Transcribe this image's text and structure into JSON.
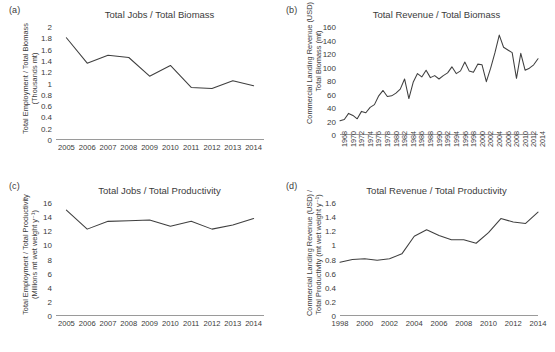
{
  "figure": {
    "background": "#ffffff",
    "line_color": "#3f3f3f",
    "axis_color": "#9a9a9a",
    "text_color": "#3b3b3b"
  },
  "panels": [
    {
      "label": "(a)",
      "name": "panel-a",
      "title": "Total Jobs / Total Biomass",
      "ylabel_line1": "Total Employment / Total Biomass",
      "ylabel_line2": "(Thousands mt)"
    },
    {
      "label": "(b)",
      "name": "panel-b",
      "title": "Total Revenue / Total Biomass",
      "ylabel_line1": "Commercial Landing Revenue (USD) /",
      "ylabel_line2": "Total Biomass (mt)"
    },
    {
      "label": "(c)",
      "name": "panel-c",
      "title": "Total Jobs / Total Productivity",
      "ylabel_line1": "Total Employment / Total Productivity",
      "ylabel_line2": "(Millions mt wet weight y⁻¹)"
    },
    {
      "label": "(d)",
      "name": "panel-d",
      "title": "Total Revenue / Total Productivity",
      "ylabel_line1": "Commercial Landing Revenue (USD) /",
      "ylabel_line2": "Total Productivity (mt wet weight y⁻¹)"
    }
  ],
  "chart_data": [
    {
      "panel": "(a)",
      "type": "line",
      "title": "Total Jobs / Total Biomass",
      "xlabel": "",
      "ylabel": "Total Employment / Total Biomass (Thousands mt)",
      "x": [
        2005,
        2006,
        2007,
        2008,
        2009,
        2010,
        2011,
        2012,
        2013,
        2014
      ],
      "values": [
        1.81,
        1.36,
        1.5,
        1.46,
        1.13,
        1.32,
        0.93,
        0.91,
        1.05,
        0.96
      ],
      "xticklabels": [
        "2005",
        "2006",
        "2007",
        "2008",
        "2009",
        "2010",
        "2011",
        "2012",
        "2013",
        "2014"
      ],
      "ylim": [
        0,
        2
      ],
      "yticks": [
        0,
        0.2,
        0.4,
        0.6,
        0.8,
        1,
        1.2,
        1.4,
        1.6,
        1.8,
        2
      ],
      "yticklabels": [
        "0",
        "0.2",
        "0.4",
        "0.6",
        "0.8",
        "1",
        "1.2",
        "1.4",
        "1.6",
        "1.8",
        "2"
      ],
      "grid": false,
      "legend": "none"
    },
    {
      "panel": "(b)",
      "type": "line",
      "title": "Total Revenue / Total Biomass",
      "xlabel": "",
      "ylabel": "Commercial Landing Revenue (USD) / Total Biomass (mt)",
      "x": [
        1968,
        1969,
        1970,
        1971,
        1972,
        1973,
        1974,
        1975,
        1976,
        1977,
        1978,
        1979,
        1980,
        1981,
        1982,
        1983,
        1984,
        1985,
        1986,
        1987,
        1988,
        1989,
        1990,
        1991,
        1992,
        1993,
        1994,
        1995,
        1996,
        1997,
        1998,
        1999,
        2000,
        2001,
        2002,
        2003,
        2004,
        2005,
        2006,
        2007,
        2008,
        2009,
        2010,
        2011,
        2012,
        2013,
        2014
      ],
      "values": [
        21,
        23,
        32,
        29,
        24,
        35,
        33,
        41,
        45,
        58,
        66,
        57,
        58,
        62,
        68,
        83,
        54,
        78,
        91,
        86,
        96,
        85,
        88,
        83,
        88,
        92,
        101,
        91,
        95,
        108,
        95,
        93,
        105,
        104,
        79,
        99,
        122,
        148,
        130,
        126,
        122,
        84,
        121,
        96,
        99,
        104,
        113
      ],
      "xticklabels": [
        "1968",
        "1970",
        "1972",
        "1974",
        "1976",
        "1978",
        "1980",
        "1982",
        "1984",
        "1986",
        "1988",
        "1990",
        "1992",
        "1994",
        "1996",
        "1998",
        "2000",
        "2002",
        "2004",
        "2006",
        "2008",
        "2010",
        "2012",
        "2014"
      ],
      "ylim": [
        0,
        160
      ],
      "yticks": [
        0,
        20,
        40,
        60,
        80,
        100,
        120,
        140,
        160
      ],
      "yticklabels": [
        "0",
        "20",
        "40",
        "60",
        "80",
        "100",
        "120",
        "140",
        "160"
      ],
      "grid": false,
      "legend": "none"
    },
    {
      "panel": "(c)",
      "type": "line",
      "title": "Total Jobs / Total Productivity",
      "xlabel": "",
      "ylabel": "Total Employment / Total Productivity (Millions mt wet weight y⁻¹)",
      "x": [
        2005,
        2006,
        2007,
        2008,
        2009,
        2010,
        2011,
        2012,
        2013,
        2014
      ],
      "values": [
        15.0,
        12.3,
        13.4,
        13.5,
        13.6,
        12.7,
        13.4,
        12.3,
        12.9,
        13.8
      ],
      "xticklabels": [
        "2005",
        "2006",
        "2007",
        "2008",
        "2009",
        "2010",
        "2011",
        "2012",
        "2013",
        "2014"
      ],
      "ylim": [
        0,
        16
      ],
      "yticks": [
        0,
        2,
        4,
        6,
        8,
        10,
        12,
        14,
        16
      ],
      "yticklabels": [
        "0",
        "2",
        "4",
        "6",
        "8",
        "10",
        "12",
        "14",
        "16"
      ],
      "grid": false,
      "legend": "none"
    },
    {
      "panel": "(d)",
      "type": "line",
      "title": "Total Revenue / Total Productivity",
      "xlabel": "",
      "ylabel": "Commercial Landing Revenue (USD) / Total Productivity (mt wet weight y⁻¹)",
      "x": [
        1998,
        1999,
        2000,
        2001,
        2002,
        2003,
        2004,
        2005,
        2006,
        2007,
        2008,
        2009,
        2010,
        2011,
        2012,
        2013,
        2014
      ],
      "values": [
        0.76,
        0.8,
        0.81,
        0.79,
        0.81,
        0.88,
        1.13,
        1.22,
        1.14,
        1.08,
        1.08,
        1.03,
        1.18,
        1.38,
        1.33,
        1.31,
        1.47
      ],
      "xticklabels": [
        "1998",
        "2000",
        "2002",
        "2004",
        "2006",
        "2008",
        "2010",
        "2012",
        "2014"
      ],
      "ylim": [
        0,
        1.6
      ],
      "yticks": [
        0,
        0.2,
        0.4,
        0.6,
        0.8,
        1,
        1.2,
        1.4,
        1.6
      ],
      "yticklabels": [
        "0",
        "0.2",
        "0.4",
        "0.6",
        "0.8",
        "1",
        "1.2",
        "1.4",
        "1.6"
      ],
      "grid": false,
      "legend": "none"
    }
  ]
}
